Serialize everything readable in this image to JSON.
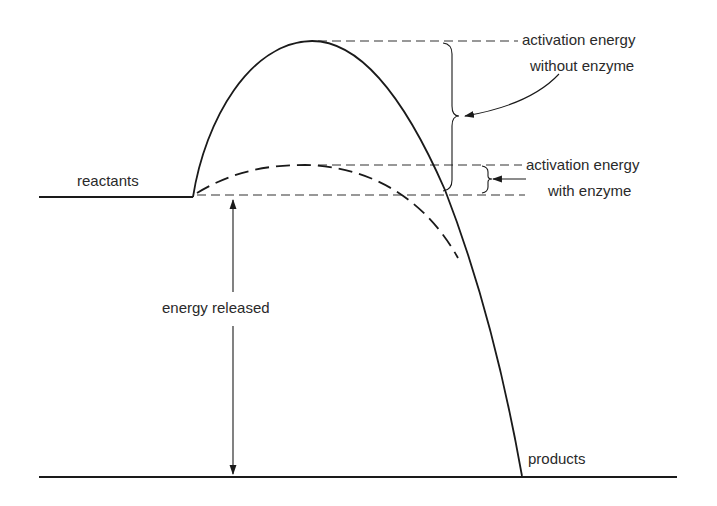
{
  "diagram": {
    "type": "energy-profile",
    "labels": {
      "reactants": "reactants",
      "products": "products",
      "energy_released": "energy released",
      "without_enzyme_line1": "activation energy",
      "without_enzyme_line2": "without enzyme",
      "with_enzyme_line1": "activation energy",
      "with_enzyme_line2": "with enzyme"
    },
    "curves": [
      {
        "name": "without-enzyme",
        "style": "solid"
      },
      {
        "name": "with-enzyme",
        "style": "dashed"
      }
    ],
    "colors": {
      "line": "#1a1a1a",
      "background": "#ffffff"
    }
  }
}
